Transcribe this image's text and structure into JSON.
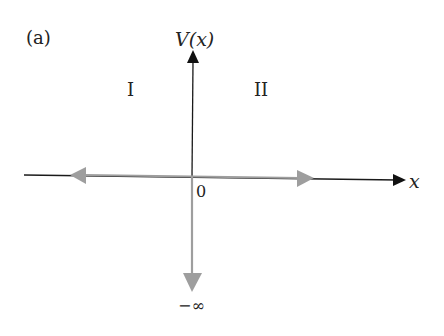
{
  "figure": {
    "panel_label": "(a)",
    "y_axis_label": "V(x)",
    "x_axis_label": "x",
    "origin_label": "0",
    "bottom_label": "−∞",
    "regions": [
      {
        "id": "I",
        "label": "I"
      },
      {
        "id": "II",
        "label": "II"
      }
    ]
  },
  "colors": {
    "axis": "#1a1a1a",
    "potential_arrows": "#9e9e9e",
    "text": "#222222"
  }
}
